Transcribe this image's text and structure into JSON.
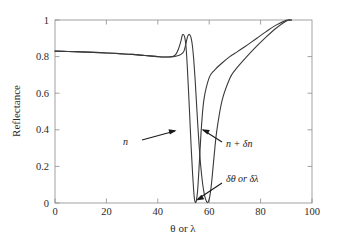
{
  "chart_data": {
    "type": "line",
    "title": "",
    "xlabel": "θ or λ",
    "ylabel": "Reflectance",
    "xlim": [
      0,
      100
    ],
    "ylim": [
      0,
      1
    ],
    "xticks": [
      0,
      20,
      40,
      60,
      80,
      100
    ],
    "yticks": [
      0,
      0.2,
      0.4,
      0.6,
      0.8,
      1
    ],
    "xtick_labels": [
      "0",
      "20",
      "40",
      "60",
      "80",
      "100"
    ],
    "ytick_labels": [
      "0",
      "0.2",
      "0.4",
      "0.6",
      "0.8",
      "1"
    ],
    "grid": false,
    "legend_position": "none",
    "series": [
      {
        "name": "n",
        "x": [
          0,
          5,
          10,
          15,
          20,
          25,
          30,
          35,
          40,
          42,
          44,
          46,
          47,
          48,
          49,
          49.5,
          50,
          50.5,
          51,
          51.5,
          52,
          52.5,
          53,
          53.5,
          54,
          54.3,
          54.6,
          55,
          55.5,
          56,
          57,
          58,
          60,
          62,
          65,
          68,
          70,
          74,
          78,
          82,
          86,
          90,
          92
        ],
        "y": [
          0.83,
          0.828,
          0.826,
          0.823,
          0.82,
          0.816,
          0.812,
          0.806,
          0.8,
          0.798,
          0.798,
          0.802,
          0.812,
          0.84,
          0.885,
          0.915,
          0.92,
          0.905,
          0.85,
          0.74,
          0.6,
          0.45,
          0.3,
          0.17,
          0.06,
          0.018,
          0.004,
          0.012,
          0.07,
          0.18,
          0.42,
          0.57,
          0.685,
          0.725,
          0.765,
          0.8,
          0.818,
          0.855,
          0.895,
          0.935,
          0.972,
          0.998,
          1.0
        ]
      },
      {
        "name": "n + δn",
        "x": [
          0,
          5,
          10,
          15,
          20,
          25,
          30,
          35,
          40,
          42,
          44,
          46,
          48,
          49,
          50,
          50.5,
          51,
          51.5,
          52,
          52.5,
          53,
          53.5,
          54,
          54.5,
          55,
          55.5,
          56,
          56.5,
          57,
          57.5,
          58,
          58.5,
          59,
          59.3,
          59.6,
          60,
          60.5,
          61,
          62,
          63,
          65,
          68,
          70,
          74,
          78,
          82,
          86,
          90,
          92
        ],
        "y": [
          0.83,
          0.828,
          0.826,
          0.823,
          0.82,
          0.816,
          0.812,
          0.806,
          0.8,
          0.798,
          0.798,
          0.8,
          0.806,
          0.812,
          0.825,
          0.845,
          0.875,
          0.905,
          0.92,
          0.918,
          0.9,
          0.855,
          0.78,
          0.68,
          0.56,
          0.44,
          0.33,
          0.235,
          0.16,
          0.1,
          0.055,
          0.025,
          0.007,
          0.003,
          0.006,
          0.02,
          0.06,
          0.12,
          0.27,
          0.4,
          0.56,
          0.68,
          0.725,
          0.79,
          0.85,
          0.905,
          0.955,
          0.995,
          1.0
        ]
      }
    ],
    "annotations": [
      {
        "id": "annot-n",
        "text": "n",
        "x": 31,
        "y": 0.37
      },
      {
        "id": "annot-n-delta-n",
        "text": "n + δn",
        "x": 68,
        "y": 0.37
      },
      {
        "id": "annot-delta-theta",
        "text": "δθ or δλ",
        "x": 71,
        "y": 0.1
      }
    ]
  },
  "axes": {
    "x_axis_title": "θ or λ",
    "y_axis_title": "Reflectance"
  },
  "colors": {
    "curve": "#3a3a3a",
    "frame": "#8a8a8a",
    "text": "#2b2b2b",
    "background": "#ffffff"
  }
}
